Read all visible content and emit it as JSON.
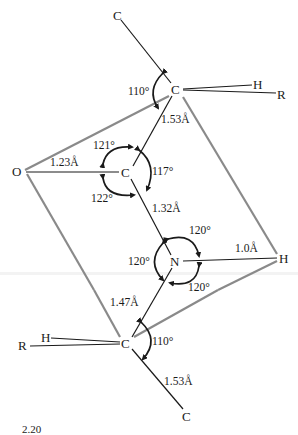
{
  "figure": {
    "type": "peptide bond geometry",
    "caption_fragment": "2.20",
    "colors": {
      "bond": "#1a1a1a",
      "plane": "#8a8a8a",
      "text": "#1a1a1a"
    }
  },
  "atoms": {
    "c_top": "C",
    "c_alpha_upper": "C",
    "h_upper": "H",
    "r_upper": "R",
    "o": "O",
    "c_carbonyl": "C",
    "n": "N",
    "h_amide": "H",
    "c_alpha_lower": "C",
    "h_lower": "H",
    "r_lower": "R",
    "c_bottom": "C"
  },
  "bond_lengths": {
    "calpha_upper_to_c": "1.53Å",
    "c_to_o": "1.23Å",
    "c_to_n": "1.32Å",
    "n_to_h": "1.0Å",
    "n_to_calpha_lower": "1.47Å",
    "calpha_lower_to_c": "1.53Å"
  },
  "bond_angles": {
    "upper_calpha": "110°",
    "carbonyl_top": "121°",
    "carbonyl_right": "117°",
    "carbonyl_bottom": "122°",
    "n_top": "120°",
    "n_left": "120°",
    "n_bottom": "120°",
    "lower_calpha": "110°"
  }
}
